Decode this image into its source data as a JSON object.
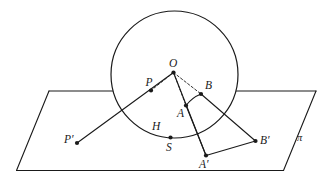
{
  "figure": {
    "plane_label": "π",
    "stroke_color": "#1a1a1a",
    "background_color": "#ffffff",
    "width": 327,
    "height": 185
  },
  "points": [
    {
      "id": "O",
      "label": "O",
      "x": 173.5,
      "y": 72.5,
      "label_x": 169.0,
      "label_y": 58.0,
      "dot": true
    },
    {
      "id": "P",
      "label": "P",
      "x": 151.0,
      "y": 90.5,
      "label_x": 145.5,
      "label_y": 76.5,
      "dot": true
    },
    {
      "id": "B",
      "label": "B",
      "x": 201.0,
      "y": 94.0,
      "label_x": 205.0,
      "label_y": 79.5,
      "dot": true
    },
    {
      "id": "A",
      "label": "A",
      "x": 186.0,
      "y": 105.5,
      "label_x": 177.0,
      "label_y": 108.0,
      "dot": true
    },
    {
      "id": "H",
      "label": "H",
      "x": 0,
      "y": 0,
      "label_x": 152.0,
      "label_y": 120.5,
      "dot": false
    },
    {
      "id": "S",
      "label": "S",
      "x": 170.5,
      "y": 137.5,
      "label_x": 166.0,
      "label_y": 141.5,
      "dot": true
    },
    {
      "id": "Pp",
      "label": "P′",
      "x": 77.0,
      "y": 143.0,
      "label_x": 64.0,
      "label_y": 134.0,
      "dot": true
    },
    {
      "id": "Bp",
      "label": "B′",
      "x": 255.5,
      "y": 141.0,
      "label_x": 260.0,
      "label_y": 135.0,
      "dot": true
    },
    {
      "id": "Ap",
      "label": "A′",
      "x": 206.0,
      "y": 155.5,
      "label_x": 199.0,
      "label_y": 159.0,
      "dot": true
    }
  ],
  "plane": {
    "name": "pi-plane",
    "corners": [
      {
        "x": 49.0,
        "y": 91.0
      },
      {
        "x": 316.0,
        "y": 91.0
      },
      {
        "x": 283.5,
        "y": 170.5
      },
      {
        "x": 16.5,
        "y": 170.5
      }
    ],
    "label": "π",
    "label_x": 297.0,
    "label_y": 133.0
  },
  "circle": {
    "name": "sphere-outline",
    "cx": 174.5,
    "cy": 74.5,
    "r": 63.5
  },
  "segments": [
    {
      "name": "segment-P-prime-to-O",
      "x1": 77.0,
      "y1": 143.0,
      "x2": 173.5,
      "y2": 72.5,
      "style": "solid",
      "through": "P"
    },
    {
      "name": "segment-O-to-A-prime",
      "x1": 173.5,
      "y1": 72.5,
      "x2": 206.0,
      "y2": 155.5,
      "style": "solid"
    },
    {
      "name": "segment-B-to-B-prime",
      "x1": 201.0,
      "y1": 94.0,
      "x2": 255.5,
      "y2": 141.0,
      "style": "solid"
    },
    {
      "name": "segment-A-prime-to-B-prime",
      "x1": 206.0,
      "y1": 155.5,
      "x2": 255.5,
      "y2": 141.0,
      "style": "solid"
    },
    {
      "name": "segment-A-to-A-prime",
      "x1": 186.0,
      "y1": 105.5,
      "x2": 206.0,
      "y2": 155.5,
      "style": "solid"
    },
    {
      "name": "dashed-O-to-P",
      "x1": 173.5,
      "y1": 72.5,
      "x2": 151.0,
      "y2": 90.5,
      "style": "dashed"
    },
    {
      "name": "dashed-O-to-A",
      "x1": 173.5,
      "y1": 72.5,
      "x2": 186.0,
      "y2": 105.5,
      "style": "dashed"
    },
    {
      "name": "dashed-O-to-B",
      "x1": 173.5,
      "y1": 72.5,
      "x2": 201.0,
      "y2": 94.0,
      "style": "dashed"
    }
  ],
  "arc": {
    "name": "arc-A-to-B",
    "path": "M 186 105.5 A 35 35 0 0 1 201 94"
  },
  "plane_edges": {
    "top_left_segment": {
      "x1": 49.0,
      "y1": 91.0,
      "x2": 112.5,
      "y2": 91.0
    },
    "top_right_segment": {
      "x1": 236.5,
      "y1": 91.0,
      "x2": 316.0,
      "y2": 91.0
    },
    "left_edge": {
      "x1": 49.0,
      "y1": 91.0,
      "x2": 16.5,
      "y2": 170.5
    },
    "right_edge": {
      "x1": 316.0,
      "y1": 91.0,
      "x2": 283.5,
      "y2": 170.5
    },
    "bottom_edge": {
      "x1": 16.5,
      "y1": 170.5,
      "x2": 283.5,
      "y2": 170.5
    }
  }
}
